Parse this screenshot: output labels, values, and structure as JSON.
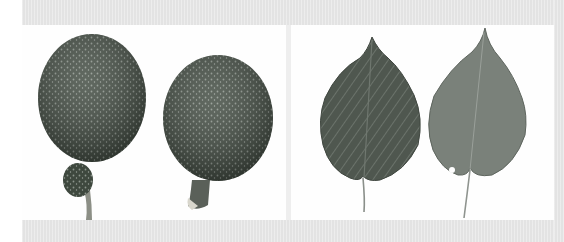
{
  "figure": {
    "panels": [
      {
        "id": "left",
        "subject": "two fruits (dark green speckled, oval, with stalks)"
      },
      {
        "id": "right",
        "subject": "two heart-shaped serrated leaves (upper and lower surface)"
      }
    ],
    "colors": {
      "background": "#ffffff",
      "border_band": "#e3e3e3",
      "fruit_dark": "#3f4a3f",
      "leaf_dark": "#4d554d",
      "leaf_light": "#7b837c"
    }
  }
}
